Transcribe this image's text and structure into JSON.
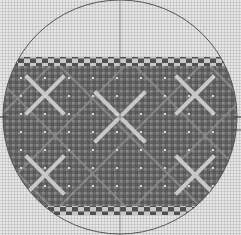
{
  "diagram": {
    "type": "circular knitting/stitch chart",
    "width": 241,
    "height": 235,
    "grid": {
      "cell_px": 3,
      "background": "#d4d4d4",
      "line_color": "#a9a9a9"
    },
    "circle": {
      "cx": 120,
      "cy": 117,
      "r": 117,
      "stroke": "#555555"
    },
    "crosshair": {
      "x": 120,
      "y": 117,
      "color": "#707070"
    },
    "band": {
      "top_y": 57,
      "bottom_y": 215,
      "fill": "#6e6e6e",
      "motif_color": "#c8c8c8",
      "border_top": {
        "y": 57,
        "height": 9,
        "pattern": "checker"
      },
      "border_bottom": {
        "y": 206,
        "height": 9,
        "pattern": "checker"
      },
      "motifs": [
        {
          "type": "X",
          "cx": 45,
          "cy": 95,
          "size": 36
        },
        {
          "type": "X",
          "cx": 195,
          "cy": 95,
          "size": 36
        },
        {
          "type": "X",
          "cx": 120,
          "cy": 117,
          "size": 48
        },
        {
          "type": "X",
          "cx": 45,
          "cy": 175,
          "size": 36
        },
        {
          "type": "X",
          "cx": 195,
          "cy": 175,
          "size": 36
        }
      ]
    },
    "side_ticks": [
      {
        "side": "left",
        "y": 117
      },
      {
        "side": "right",
        "y": 117
      },
      {
        "side": "right",
        "y": 130
      }
    ]
  }
}
